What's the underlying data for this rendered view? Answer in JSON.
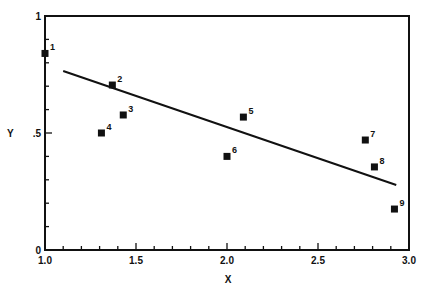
{
  "chart_data": {
    "type": "scatter",
    "title": "",
    "xlabel": "X",
    "ylabel": "Y",
    "xlim": [
      1.0,
      3.0
    ],
    "ylim": [
      0,
      1
    ],
    "grid": false,
    "legend": null,
    "x_ticks": [
      {
        "value": 1.0,
        "label": "1.0"
      },
      {
        "value": 1.5,
        "label": "1.5"
      },
      {
        "value": 2.0,
        "label": "2.0"
      },
      {
        "value": 2.5,
        "label": "2.5"
      },
      {
        "value": 3.0,
        "label": "3.0"
      }
    ],
    "y_ticks": [
      {
        "value": 0,
        "label": "0"
      },
      {
        "value": 0.5,
        "label": ".5"
      },
      {
        "value": 1,
        "label": "1"
      }
    ],
    "x_minor_step": 0.1,
    "y_minor_step": 0.1,
    "series": [
      {
        "name": "points",
        "marker": "square",
        "color": "#111111",
        "points": [
          {
            "label": "1",
            "x": 1.0,
            "y": 0.84
          },
          {
            "label": "2",
            "x": 1.37,
            "y": 0.705
          },
          {
            "label": "3",
            "x": 1.43,
            "y": 0.577
          },
          {
            "label": "4",
            "x": 1.31,
            "y": 0.5
          },
          {
            "label": "5",
            "x": 2.09,
            "y": 0.568
          },
          {
            "label": "6",
            "x": 2.0,
            "y": 0.4
          },
          {
            "label": "7",
            "x": 2.76,
            "y": 0.47
          },
          {
            "label": "8",
            "x": 2.81,
            "y": 0.355
          },
          {
            "label": "9",
            "x": 2.92,
            "y": 0.175
          }
        ]
      }
    ],
    "fit_line": {
      "name": "regression line",
      "x": [
        1.1,
        2.93
      ],
      "y": [
        0.765,
        0.278
      ],
      "color": "#111111"
    }
  }
}
